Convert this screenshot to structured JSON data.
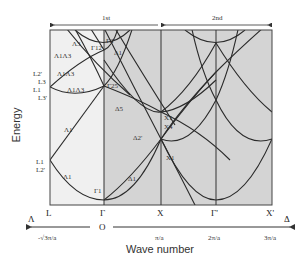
{
  "diagram": {
    "type": "band-structure",
    "y_axis_title": "Energy",
    "x_axis_title": "Wave number",
    "zones": [
      {
        "label": "1st",
        "direction": "left"
      },
      {
        "label": "2nd",
        "direction": "both"
      }
    ],
    "colors": {
      "zone1_fill": "#f0f0f0",
      "zone2_fill": "#d4d4d4",
      "line": "#2a2a2a"
    },
    "symmetry_points": [
      "L",
      "Γ",
      "X",
      "Γ'",
      "X'"
    ],
    "axis": {
      "origin_label": "O",
      "left_direction": "Λ",
      "right_direction": "Δ",
      "ticks": [
        "-√3π/a",
        "π/a",
        "2π/a",
        "3π/a"
      ]
    },
    "left_labels": {
      "upper": [
        "L2'",
        "L3",
        "L1",
        "L3'"
      ],
      "lower": [
        "L1",
        "L2'"
      ]
    },
    "band_labels": {
      "lambda3": "Λ3",
      "lambda1_lambda3_a": "Λ1Λ3",
      "lambda1_lambda3_b": "Λ1Λ3",
      "lambda1_lambda3_c": "Λ1Λ3",
      "lambda1_upper": "Λ1",
      "lambda1_lower": "Λ1",
      "gamma12": "Γ12",
      "gamma2p": "Γ2'",
      "gamma25p": "Γ25'",
      "gamma1": "Γ1",
      "delta1_upper": "Δ1",
      "delta5": "Δ5",
      "delta2p": "Δ2'",
      "delta1_lower": "Δ1",
      "x1_upper": "X1",
      "x4": "X4",
      "x1_lower": "X1"
    }
  }
}
